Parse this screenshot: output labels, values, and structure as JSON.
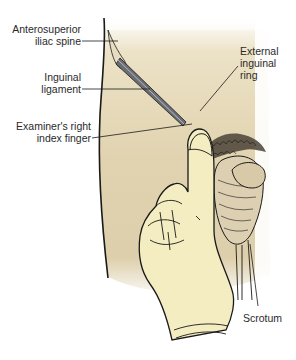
{
  "figure": {
    "colors": {
      "background": "#ffffff",
      "skin": "#e3d6b4",
      "skin_shadow": "#c9b98f",
      "glove": "#f3ecbe",
      "outline": "#1a1a1a",
      "instrument": "#5a5d63",
      "hair": "#2a2a2a"
    },
    "labels": [
      {
        "id": "asis",
        "line1": "Anterosuperior",
        "line2": "iliac spine"
      },
      {
        "id": "ligament",
        "line1": "Inguinal",
        "line2": "ligament"
      },
      {
        "id": "finger",
        "line1": "Examiner's right",
        "line2": "index finger"
      },
      {
        "id": "ring",
        "line1": "External",
        "line2": "inguinal",
        "line3": "ring"
      },
      {
        "id": "scrotum",
        "line1": "Scrotum"
      }
    ]
  }
}
